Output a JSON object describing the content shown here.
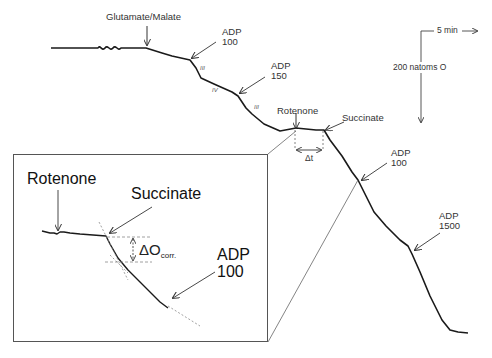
{
  "main_trace": {
    "additions": [
      {
        "label": "Glutamate/Malate"
      },
      {
        "label_line1": "ADP",
        "label_line2": "100"
      },
      {
        "label_line1": "ADP",
        "label_line2": "150"
      },
      {
        "label": "Rotenone"
      },
      {
        "label": "Succinate"
      },
      {
        "label_line1": "ADP",
        "label_line2": "100"
      },
      {
        "label_line1": "ADP",
        "label_line2": "1500"
      }
    ],
    "states": [
      "III",
      "IV",
      "III"
    ],
    "delta_t_label": "Δt"
  },
  "scale_bar": {
    "time_label": "5 min",
    "oxygen_label": "200 natoms O"
  },
  "inset": {
    "rotenone_label": "Rotenone",
    "succinate_label": "Succinate",
    "delta_o_label": "ΔO",
    "delta_o_sub": "corr.",
    "adp_line1": "ADP",
    "adp_line2": "100"
  },
  "colors": {
    "trace": "#1a1a1a",
    "annotation": "#444444",
    "dashed": "#777777"
  }
}
